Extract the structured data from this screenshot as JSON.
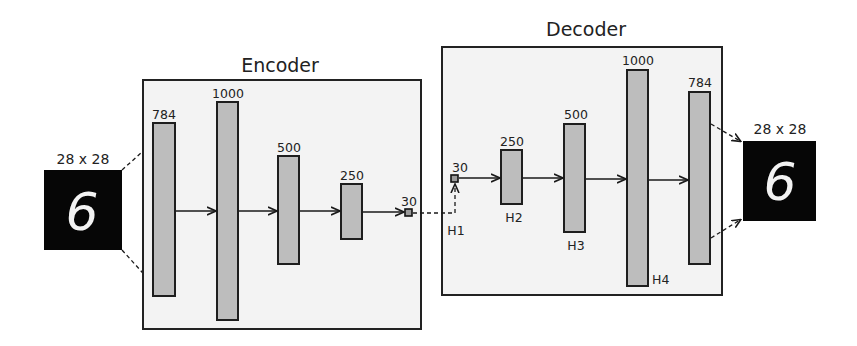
{
  "diagram": {
    "type": "autoencoder-architecture",
    "colors": {
      "panel_fill": "#f3f3f3",
      "bar_fill": "#bdbdbd",
      "stroke": "#1e1e1e",
      "image_bg": "#060606",
      "digit": "#f2f2f2"
    },
    "input_image": {
      "label": "28 x 28",
      "digit": "6"
    },
    "output_image": {
      "label": "28 x 28",
      "digit": "6"
    },
    "encoder": {
      "title": "Encoder",
      "layers": [
        {
          "units": "784",
          "hidden_label": ""
        },
        {
          "units": "1000",
          "hidden_label": ""
        },
        {
          "units": "500",
          "hidden_label": ""
        },
        {
          "units": "250",
          "hidden_label": ""
        }
      ],
      "code": {
        "units": "30"
      }
    },
    "decoder": {
      "title": "Decoder",
      "code": {
        "units": "30",
        "hidden_label": "H1"
      },
      "layers": [
        {
          "units": "250",
          "hidden_label": "H2"
        },
        {
          "units": "500",
          "hidden_label": "H3"
        },
        {
          "units": "1000",
          "hidden_label": "H4"
        },
        {
          "units": "784",
          "hidden_label": ""
        }
      ]
    }
  }
}
